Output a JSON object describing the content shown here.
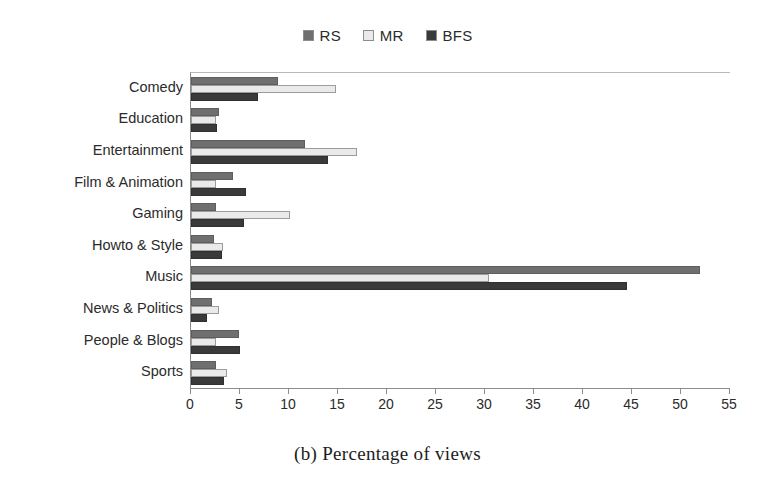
{
  "chart_data": {
    "type": "bar",
    "orientation": "horizontal",
    "title": "",
    "xlabel": "",
    "ylabel": "",
    "xlim": [
      0,
      55
    ],
    "xticks": [
      0,
      5,
      10,
      15,
      20,
      25,
      30,
      35,
      40,
      45,
      50,
      55
    ],
    "grid": false,
    "legend_position": "top-center",
    "categories": [
      "Comedy",
      "Education",
      "Entertainment",
      "Film & Animation",
      "Gaming",
      "Howto & Style",
      "Music",
      "News & Politics",
      "People & Blogs",
      "Sports"
    ],
    "series": [
      {
        "name": "RS",
        "color": "#6f6f6f",
        "values": [
          8.9,
          2.9,
          11.6,
          4.3,
          2.5,
          2.3,
          51.9,
          2.1,
          4.9,
          2.6
        ]
      },
      {
        "name": "MR",
        "color": "#eaeaea",
        "values": [
          14.8,
          2.5,
          16.9,
          2.5,
          10.1,
          3.3,
          30.4,
          2.9,
          2.6,
          3.7
        ]
      },
      {
        "name": "BFS",
        "color": "#3a3a3a",
        "values": [
          6.8,
          2.7,
          14.0,
          5.6,
          5.4,
          3.2,
          44.5,
          1.6,
          5.0,
          3.4
        ]
      }
    ]
  },
  "caption": "(b) Percentage of views"
}
